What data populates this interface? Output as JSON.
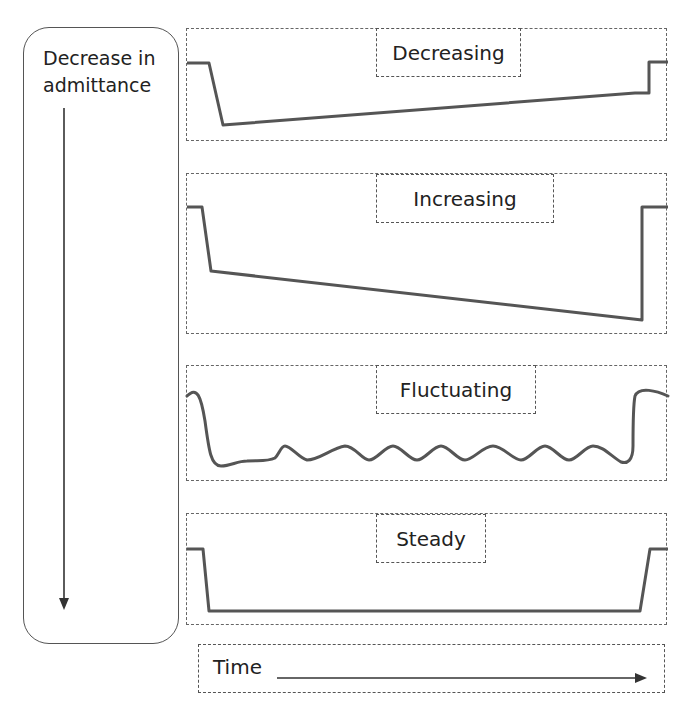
{
  "left_panel": {
    "label_line1": "Decrease in",
    "label_line2": "admittance",
    "arrow_direction": "down"
  },
  "panels": [
    {
      "id": "decreasing",
      "title": "Decreasing",
      "pattern": "drop then gradual rise of trace before return"
    },
    {
      "id": "increasing",
      "title": "Increasing",
      "pattern": "drop then gradual further decline before return"
    },
    {
      "id": "fluctuating",
      "title": "Fluctuating",
      "pattern": "drop then oscillating trace before return"
    },
    {
      "id": "steady",
      "title": "Steady",
      "pattern": "drop then flat trace before return"
    }
  ],
  "time_axis": {
    "label": "Time",
    "arrow_direction": "right"
  },
  "colors": {
    "trace": "#555555",
    "border": "#555555"
  }
}
